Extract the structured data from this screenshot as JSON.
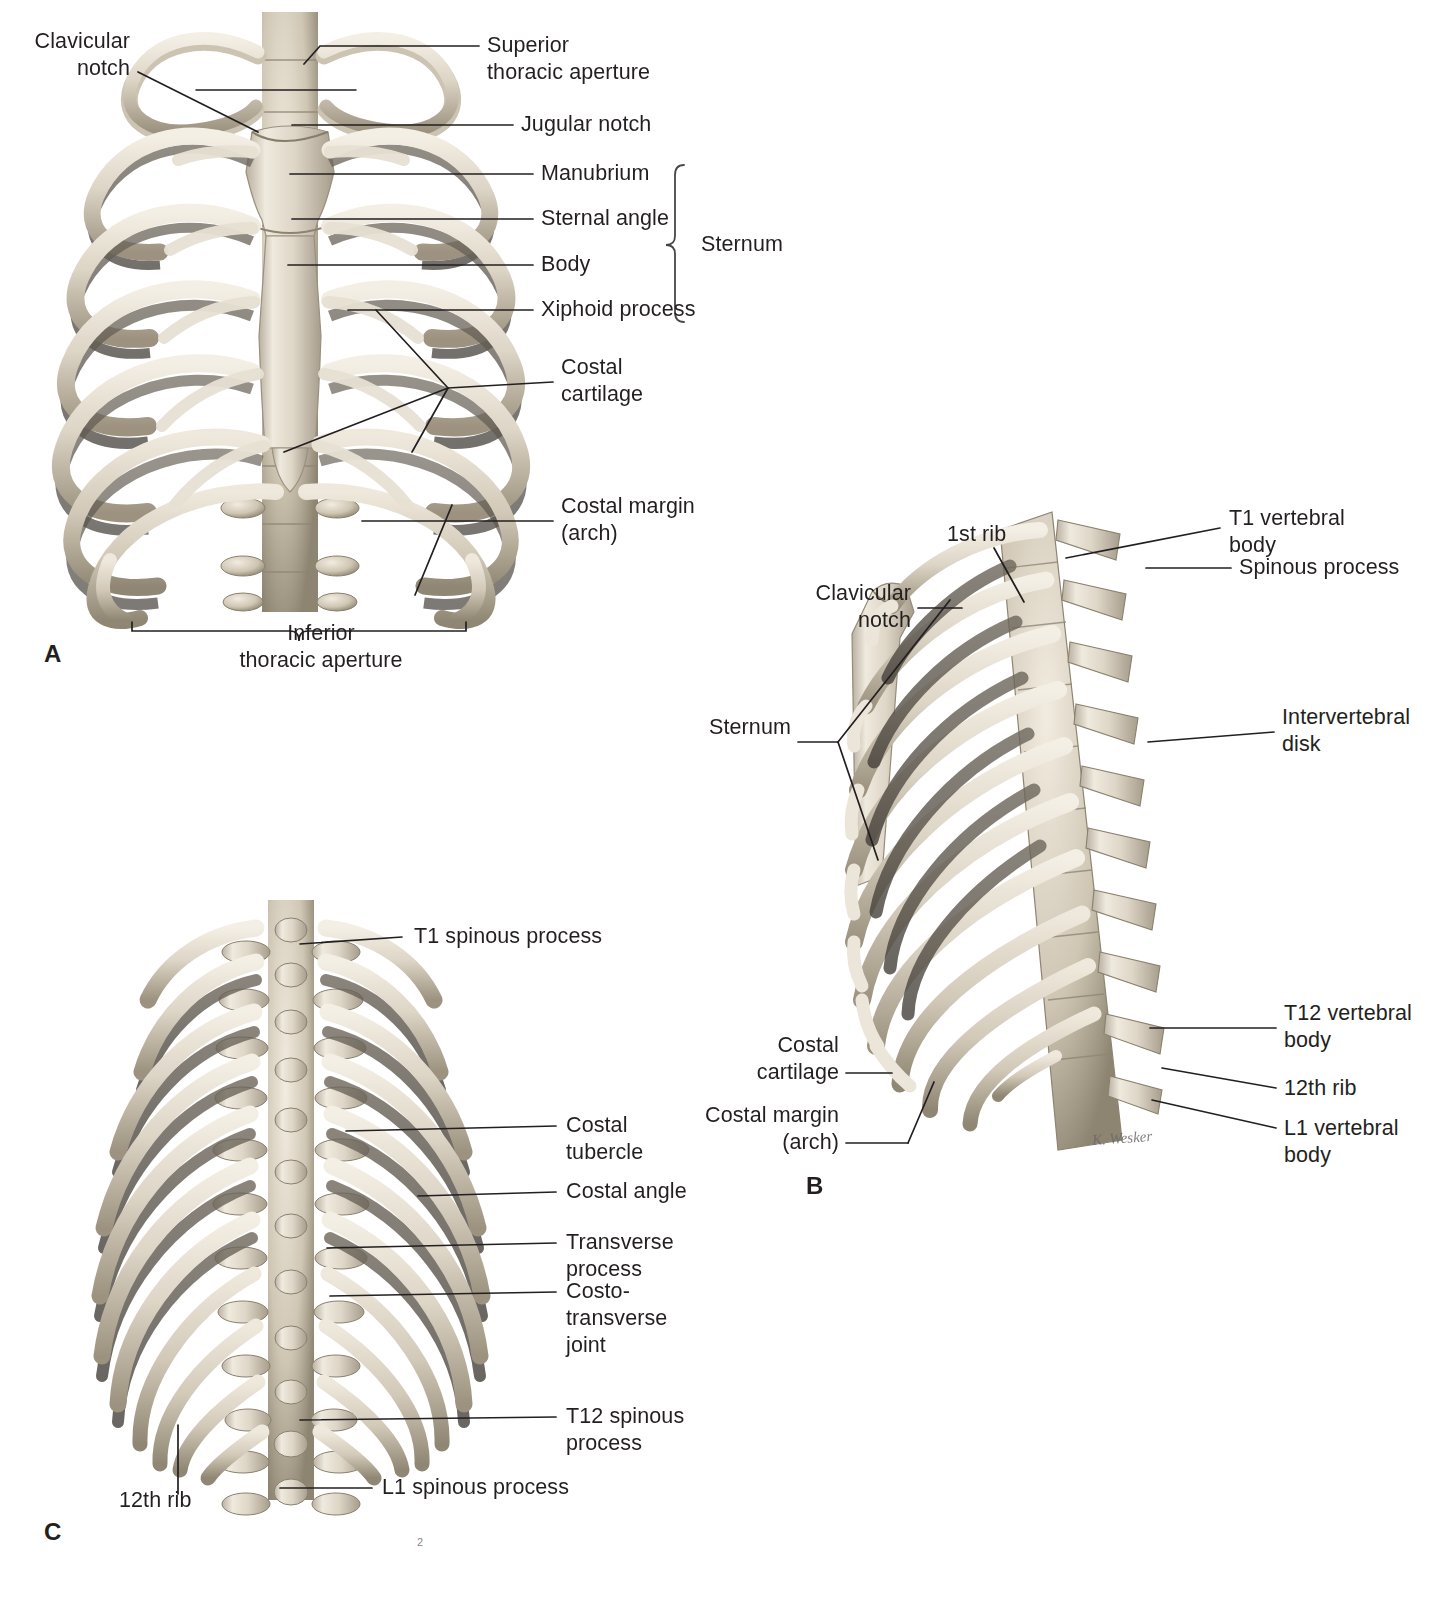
{
  "figure": {
    "background_color": "#ffffff",
    "text_color": "#231f20",
    "bone_light": "#f1ece3",
    "bone_mid": "#cdc4b4",
    "bone_dark": "#8e8madeup",
    "page_number": "2"
  },
  "panels": [
    {
      "letter": "A",
      "view": "anterior view of the thoracic skeleton",
      "labels": [
        {
          "id": "clavicular-notch",
          "text": "Clavicular\nnotch"
        },
        {
          "id": "superior-thoracic-aperture",
          "text": "Superior\nthoracic aperture"
        },
        {
          "id": "jugular-notch",
          "text": "Jugular notch"
        },
        {
          "id": "manubrium",
          "text": "Manubrium"
        },
        {
          "id": "sternal-angle",
          "text": "Sternal angle"
        },
        {
          "id": "body",
          "text": "Body"
        },
        {
          "id": "xiphoid-process",
          "text": "Xiphoid process"
        },
        {
          "id": "sternum-brace",
          "text": "Sternum"
        },
        {
          "id": "costal-cartilage",
          "text": "Costal\ncartilage"
        },
        {
          "id": "costal-margin",
          "text": "Costal margin\n(arch)"
        },
        {
          "id": "inferior-thoracic-aperture",
          "text": "Inferior\nthoracic aperture"
        }
      ]
    },
    {
      "letter": "B",
      "view": "left lateral view of the thoracic skeleton",
      "signature": "K. Wesker",
      "labels": [
        {
          "id": "first-rib",
          "text": "1st rib"
        },
        {
          "id": "t1-vertebral-body",
          "text": "T1 vertebral\nbody"
        },
        {
          "id": "spinous-process",
          "text": "Spinous process"
        },
        {
          "id": "clavicular-notch",
          "text": "Clavicular\nnotch"
        },
        {
          "id": "sternum",
          "text": "Sternum"
        },
        {
          "id": "intervertebral-disk",
          "text": "Intervertebral\ndisk"
        },
        {
          "id": "costal-cartilage",
          "text": "Costal\ncartilage"
        },
        {
          "id": "costal-margin",
          "text": "Costal margin\n(arch)"
        },
        {
          "id": "t12-vertebral-body",
          "text": "T12 vertebral\nbody"
        },
        {
          "id": "twelfth-rib",
          "text": "12th rib"
        },
        {
          "id": "l1-vertebral-body",
          "text": "L1 vertebral\nbody"
        }
      ]
    },
    {
      "letter": "C",
      "view": "posterior view of the thoracic skeleton",
      "labels": [
        {
          "id": "t1-spinous-process",
          "text": "T1 spinous process"
        },
        {
          "id": "costal-tubercle",
          "text": "Costal\ntubercle"
        },
        {
          "id": "costal-angle",
          "text": "Costal angle"
        },
        {
          "id": "transverse-process",
          "text": "Transverse\nprocess"
        },
        {
          "id": "costotransverse-joint",
          "text": "Costo-\ntransverse\njoint"
        },
        {
          "id": "t12-spinous-process",
          "text": "T12 spinous\nprocess"
        },
        {
          "id": "twelfth-rib",
          "text": "12th rib"
        },
        {
          "id": "l1-spinous-process",
          "text": "L1 spinous process"
        }
      ]
    }
  ]
}
